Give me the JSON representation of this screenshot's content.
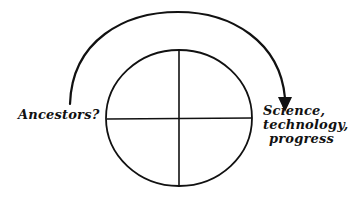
{
  "diagram": {
    "type": "circle-with-arc-arrow",
    "colors": {
      "stroke": "#111111",
      "background": "#ffffff"
    },
    "circle": {
      "quadrants": 4,
      "divided_by": "cross"
    },
    "arrow": {
      "from": "left",
      "to": "right",
      "path": "arc-over-circle",
      "head": "filled-triangle"
    },
    "labels": {
      "left": "Ancestors?",
      "right": [
        "Science,",
        "technology,",
        "progress"
      ]
    }
  }
}
